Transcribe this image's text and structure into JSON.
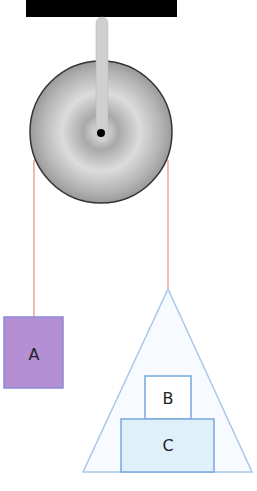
{
  "diagram": {
    "type": "pulley-system",
    "labels": {
      "block_a": "A",
      "block_b": "B",
      "block_c": "C"
    },
    "colors": {
      "support": "#000000",
      "rod": "#c9c9c9",
      "pulley": "#b9b9b9",
      "rope": "#e59a84",
      "block_a_fill": "#b48fd3",
      "block_a_stroke": "#8a8ad8",
      "triangle_fill": "#f7fbff",
      "triangle_stroke": "#a9c7ea",
      "block_b_fill": "#ffffff",
      "block_c_fill": "#dff0fb",
      "block_stroke": "#7aa6df"
    }
  }
}
